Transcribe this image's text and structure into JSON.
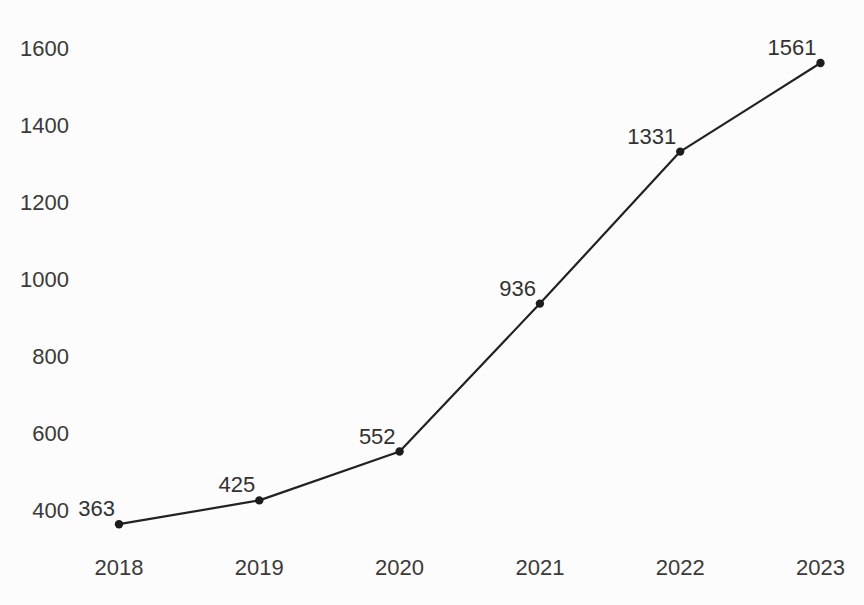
{
  "chart_data": {
    "type": "line",
    "title": "",
    "xlabel": "",
    "ylabel": "",
    "categories": [
      "2018",
      "2019",
      "2020",
      "2021",
      "2022",
      "2023"
    ],
    "series": [
      {
        "name": "values",
        "values": [
          363,
          425,
          552,
          936,
          1331,
          1561
        ]
      }
    ],
    "yticks": [
      400,
      600,
      800,
      1000,
      1200,
      1400,
      1600
    ],
    "ylim": [
      400,
      1600
    ],
    "grid": false,
    "legend": false,
    "axis_lines": false,
    "point_labels_visible": true,
    "colors": {
      "line": "#222222",
      "marker": "#1c1c1c",
      "tick_text": "#3a3a3a",
      "label_text": "#323232",
      "background": "#fcfcfc"
    }
  }
}
